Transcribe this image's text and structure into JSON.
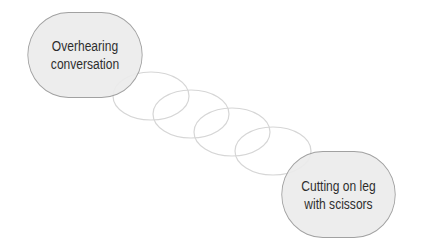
{
  "diagram": {
    "type": "chain-link",
    "nodes": [
      {
        "id": "a",
        "lines": [
          "Overhearing",
          "conversation"
        ]
      },
      {
        "id": "b",
        "lines": [
          "Cutting on leg",
          "with scissors"
        ]
      }
    ],
    "link_count": 4,
    "colors": {
      "node_fill": "#ececec",
      "node_border": "#9a9a9a",
      "link_stroke": "#d6d6d6",
      "text": "#1a1a1a"
    }
  }
}
